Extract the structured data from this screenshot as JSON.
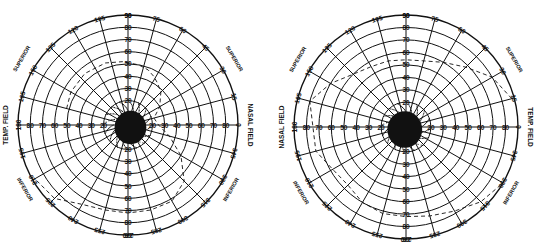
{
  "charts": [
    {
      "id": "left",
      "eye": "left-chart",
      "center": [
        128,
        125
      ],
      "radius": 110,
      "field_labels": {
        "left": "TEMP. FIELD",
        "right": "NASAL FIELD"
      },
      "quadrant_labels": {
        "upper_left": "SUPERIOR",
        "upper_right": "SUPERIOR",
        "lower_left": "INFERIOR",
        "lower_right": "INFERIOR"
      },
      "angle_labels": [
        "0",
        "15",
        "30",
        "45",
        "60",
        "75",
        "90",
        "105",
        "120",
        "135",
        "150",
        "165",
        "180",
        "195",
        "210",
        "225",
        "240",
        "255",
        "270",
        "285",
        "300",
        "315",
        "330",
        "345"
      ],
      "ring_labels": [
        "10",
        "20",
        "30",
        "40",
        "50",
        "60",
        "70",
        "80",
        "90"
      ],
      "isopter_dashed": [
        [
          165,
          52
        ],
        [
          150,
          54
        ],
        [
          130,
          55
        ],
        [
          110,
          54
        ],
        [
          95,
          52
        ],
        [
          80,
          50
        ],
        [
          70,
          48
        ],
        [
          62,
          45
        ],
        [
          55,
          42
        ],
        [
          45,
          38
        ],
        [
          30,
          30
        ],
        [
          15,
          22
        ],
        [
          0,
          25
        ],
        [
          345,
          35
        ],
        [
          330,
          50
        ],
        [
          315,
          65
        ],
        [
          300,
          72
        ],
        [
          285,
          72
        ],
        [
          270,
          72
        ],
        [
          255,
          72
        ],
        [
          240,
          75
        ],
        [
          225,
          85
        ],
        [
          210,
          88
        ]
      ],
      "blind_spot": {
        "radius_deg": 13,
        "offset_deg": [
          2,
          -2
        ]
      }
    },
    {
      "id": "right",
      "eye": "right-chart",
      "center": [
        406,
        127
      ],
      "radius": 112,
      "field_labels": {
        "left": "NASAL FIELD",
        "right": "TEMP. FIELD"
      },
      "quadrant_labels": {
        "upper_left": "SUPERIOR",
        "upper_right": "SUPERIOR",
        "lower_left": "INFERIOR",
        "lower_right": "INFERIOR"
      },
      "angle_labels": [
        "0",
        "15",
        "30",
        "45",
        "60",
        "75",
        "90",
        "105",
        "120",
        "135",
        "150",
        "165",
        "180",
        "195",
        "210",
        "225",
        "240",
        "255",
        "270",
        "285",
        "300",
        "315",
        "330",
        "345"
      ],
      "ring_labels": [
        "10",
        "20",
        "30",
        "40",
        "50",
        "60",
        "70",
        "80",
        "90"
      ],
      "isopter_dashed": [
        [
          15,
          88
        ],
        [
          30,
          80
        ],
        [
          45,
          68
        ],
        [
          60,
          60
        ],
        [
          75,
          55
        ],
        [
          90,
          54
        ],
        [
          105,
          55
        ],
        [
          120,
          56
        ],
        [
          135,
          60
        ],
        [
          150,
          70
        ],
        [
          165,
          80
        ],
        [
          195,
          75
        ],
        [
          210,
          68
        ],
        [
          225,
          66
        ],
        [
          240,
          70
        ],
        [
          255,
          72
        ],
        [
          270,
          72
        ],
        [
          285,
          74
        ],
        [
          300,
          78
        ],
        [
          315,
          85
        ],
        [
          330,
          90
        ]
      ],
      "blind_spot": {
        "radius_deg": 14,
        "offset_deg": [
          -1,
          -2
        ]
      }
    }
  ],
  "colors": {
    "ink": "#111111",
    "paper": "#ffffff"
  }
}
